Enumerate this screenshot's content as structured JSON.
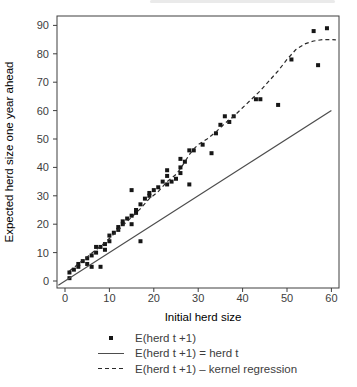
{
  "chart_data": {
    "type": "scatter",
    "title": "",
    "xlabel": "Initial herd size",
    "ylabel": "Expected herd size one year ahead",
    "xlim": [
      -2,
      62
    ],
    "ylim": [
      -3,
      93
    ],
    "x_ticks": [
      0,
      10,
      20,
      30,
      40,
      50,
      60
    ],
    "y_ticks": [
      0,
      10,
      20,
      30,
      40,
      50,
      60,
      70,
      80,
      90
    ],
    "grid": false,
    "legend_position": "bottom",
    "series": [
      {
        "name": "E(herd t +1)",
        "kind": "scatter",
        "marker": "square",
        "points": [
          [
            1,
            1
          ],
          [
            1,
            3
          ],
          [
            2,
            4
          ],
          [
            3,
            5
          ],
          [
            3,
            6
          ],
          [
            4,
            7
          ],
          [
            5,
            6
          ],
          [
            5,
            8
          ],
          [
            6,
            5
          ],
          [
            6,
            9
          ],
          [
            7,
            10
          ],
          [
            7,
            12
          ],
          [
            8,
            5
          ],
          [
            8,
            12
          ],
          [
            9,
            11
          ],
          [
            9,
            13
          ],
          [
            10,
            14
          ],
          [
            10,
            16
          ],
          [
            11,
            17
          ],
          [
            12,
            18
          ],
          [
            12,
            19
          ],
          [
            13,
            20
          ],
          [
            13,
            21
          ],
          [
            14,
            22
          ],
          [
            15,
            20
          ],
          [
            15,
            23
          ],
          [
            15,
            32
          ],
          [
            16,
            24
          ],
          [
            16,
            25
          ],
          [
            17,
            14
          ],
          [
            17,
            27
          ],
          [
            18,
            29
          ],
          [
            19,
            30
          ],
          [
            19,
            31
          ],
          [
            20,
            32
          ],
          [
            21,
            33
          ],
          [
            22,
            35
          ],
          [
            23,
            34
          ],
          [
            23,
            37
          ],
          [
            23,
            39
          ],
          [
            24,
            35
          ],
          [
            25,
            36
          ],
          [
            26,
            38
          ],
          [
            26,
            40
          ],
          [
            26,
            43
          ],
          [
            27,
            42
          ],
          [
            28,
            34
          ],
          [
            28,
            46
          ],
          [
            29,
            46
          ],
          [
            31,
            48
          ],
          [
            33,
            45
          ],
          [
            34,
            52
          ],
          [
            35,
            55
          ],
          [
            36,
            58
          ],
          [
            37,
            56
          ],
          [
            38,
            58
          ],
          [
            43,
            64
          ],
          [
            44,
            64
          ],
          [
            48,
            62
          ],
          [
            51,
            78
          ],
          [
            56,
            88
          ],
          [
            57,
            76
          ],
          [
            59,
            89
          ]
        ]
      },
      {
        "name": "E(herd t +1) = herd t",
        "kind": "line",
        "style": "solid",
        "points": [
          [
            -1.5,
            -1.5
          ],
          [
            60,
            60
          ]
        ]
      },
      {
        "name": "E(herd t +1) – kernel regression",
        "kind": "line",
        "style": "dashed",
        "points": [
          [
            1,
            3.5
          ],
          [
            3,
            6
          ],
          [
            5,
            8.5
          ],
          [
            7,
            11
          ],
          [
            9,
            13.5
          ],
          [
            11,
            16.5
          ],
          [
            13,
            19.5
          ],
          [
            15,
            22.5
          ],
          [
            17,
            25.5
          ],
          [
            19,
            29
          ],
          [
            21,
            31.5
          ],
          [
            23,
            35
          ],
          [
            25,
            37.5
          ],
          [
            26,
            39.5
          ],
          [
            27,
            42
          ],
          [
            28,
            44.5
          ],
          [
            29,
            46.5
          ],
          [
            30,
            48
          ],
          [
            32,
            50
          ],
          [
            34,
            52.5
          ],
          [
            36,
            55.5
          ],
          [
            38,
            58
          ],
          [
            40,
            61
          ],
          [
            42,
            64
          ],
          [
            44,
            67
          ],
          [
            46,
            70.5
          ],
          [
            48,
            74
          ],
          [
            50,
            78
          ],
          [
            52,
            81.5
          ],
          [
            54,
            83.5
          ],
          [
            56,
            84.5
          ],
          [
            58,
            85
          ],
          [
            60,
            85
          ],
          [
            61,
            84.9
          ]
        ]
      }
    ]
  },
  "legend": {
    "items": [
      {
        "sample": "square-marker",
        "label": "E(herd t +1)"
      },
      {
        "sample": "solid-line",
        "label": "E(herd t +1) = herd t"
      },
      {
        "sample": "dashed-line",
        "label": "E(herd t +1) – kernel regression"
      }
    ]
  },
  "colors": {
    "background": "#ffffff",
    "marker": "#161616",
    "solid_line": "#4d4d4d",
    "dashed_line": "#2a2a2a",
    "axis": "#3f3f3f",
    "text": "#3d3d3d"
  }
}
